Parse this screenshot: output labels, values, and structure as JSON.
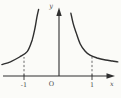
{
  "figure": {
    "y_axis_label": "y",
    "x_axis_label": "x",
    "origin_label": "O",
    "tick_labels": [
      "-1",
      "1"
    ],
    "stroke_color": "#2f2f2f",
    "guide_color": "#5a5a5a",
    "label_color": "#4a4a4a",
    "background_color": "#fbfbf8"
  },
  "chart_data": {
    "type": "line",
    "title": "",
    "xlabel": "x",
    "ylabel": "y",
    "origin_label": "O",
    "x_ticks": [
      -1,
      1
    ],
    "xlim": [
      -1.8,
      1.9
    ],
    "ylim": [
      0,
      3.6
    ],
    "grid": false,
    "legend": false,
    "series": [
      {
        "name": "left-branch",
        "points": [
          [
            -1.65,
            0.6
          ],
          [
            -1.4,
            0.75
          ],
          [
            -1.13,
            1.0
          ],
          [
            -0.9,
            1.3
          ],
          [
            -0.76,
            1.9
          ],
          [
            -0.68,
            2.5
          ],
          [
            -0.62,
            3.1
          ],
          [
            -0.57,
            3.5
          ]
        ]
      },
      {
        "name": "right-branch",
        "points": [
          [
            0.38,
            3.3
          ],
          [
            0.44,
            2.8
          ],
          [
            0.53,
            2.3
          ],
          [
            0.65,
            1.7
          ],
          [
            0.8,
            1.3
          ],
          [
            0.94,
            1.1
          ],
          [
            1.15,
            0.95
          ],
          [
            1.4,
            0.84
          ],
          [
            1.6,
            0.79
          ],
          [
            1.76,
            0.74
          ]
        ]
      }
    ],
    "guides": [
      {
        "x": -1,
        "y": 1.0
      },
      {
        "x": 1,
        "y": 1.05
      }
    ]
  }
}
